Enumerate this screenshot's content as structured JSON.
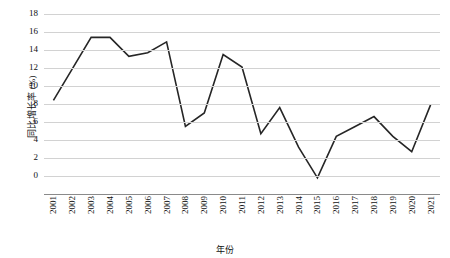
{
  "chart_data": {
    "type": "line",
    "title": "",
    "xlabel": "年份",
    "ylabel": "同比增长率 (%)",
    "ylim": [
      -2,
      18
    ],
    "yticks": [
      -2,
      0,
      2,
      4,
      6,
      8,
      10,
      12,
      14,
      16,
      18
    ],
    "grid": true,
    "legend": "none",
    "line_color": "#262626",
    "categories": [
      "2001",
      "2002",
      "2003",
      "2004",
      "2005",
      "2006",
      "2007",
      "2008",
      "2009",
      "2010",
      "2011",
      "2012",
      "2013",
      "2014",
      "2015",
      "2016",
      "2017",
      "2018",
      "2019",
      "2020",
      "2021"
    ],
    "values": [
      8.4,
      11.9,
      15.4,
      15.4,
      13.3,
      13.7,
      14.9,
      5.5,
      7.0,
      13.5,
      12.1,
      4.7,
      7.6,
      3.2,
      -0.2,
      4.4,
      5.5,
      6.6,
      4.4,
      2.7,
      7.9
    ],
    "series": [
      {
        "name": "同比增长率",
        "values": [
          8.4,
          11.9,
          15.4,
          15.4,
          13.3,
          13.7,
          14.9,
          5.5,
          7.0,
          13.5,
          12.1,
          4.7,
          7.6,
          3.2,
          -0.2,
          4.4,
          5.5,
          6.6,
          4.4,
          2.7,
          7.9
        ]
      }
    ]
  }
}
